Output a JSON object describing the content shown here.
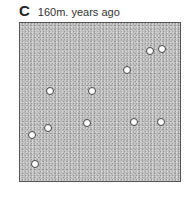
{
  "header": {
    "panel_letter": "C",
    "caption": "160m. years ago"
  },
  "panel": {
    "background_color": "#bdbdbd",
    "border_color": "#555555",
    "dots": [
      {
        "x": 150,
        "y": 51
      },
      {
        "x": 162,
        "y": 49
      },
      {
        "x": 127,
        "y": 70
      },
      {
        "x": 50,
        "y": 91
      },
      {
        "x": 92,
        "y": 91
      },
      {
        "x": 48,
        "y": 128
      },
      {
        "x": 87,
        "y": 123
      },
      {
        "x": 32,
        "y": 135
      },
      {
        "x": 134,
        "y": 122
      },
      {
        "x": 161,
        "y": 122
      },
      {
        "x": 35,
        "y": 164
      }
    ]
  }
}
